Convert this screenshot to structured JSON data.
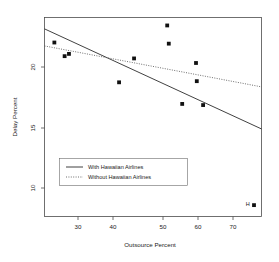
{
  "chart_data": {
    "type": "scatter",
    "title": "",
    "xlabel": "Outsource Percent",
    "ylabel": "Delay Percent",
    "xlim": [
      21.5,
      76.5
    ],
    "ylim": [
      7.3,
      24.8
    ],
    "xticks": [
      30,
      40,
      50,
      60,
      70
    ],
    "yticks": [
      20,
      15,
      10
    ],
    "xtick_labels": [
      "30",
      "40",
      "50",
      "60",
      "70"
    ],
    "ytick_labels": [
      "20",
      "15",
      "10"
    ],
    "grid": false,
    "legend_position": "center-left",
    "points": [
      {
        "x": 24.0,
        "y": 22.6,
        "label": ""
      },
      {
        "x": 26.6,
        "y": 21.4,
        "label": ""
      },
      {
        "x": 27.7,
        "y": 21.6,
        "label": ""
      },
      {
        "x": 40.4,
        "y": 19.1,
        "label": ""
      },
      {
        "x": 44.2,
        "y": 21.2,
        "label": ""
      },
      {
        "x": 52.6,
        "y": 24.1,
        "label": ""
      },
      {
        "x": 53.0,
        "y": 22.5,
        "label": ""
      },
      {
        "x": 56.4,
        "y": 17.2,
        "label": ""
      },
      {
        "x": 59.9,
        "y": 20.8,
        "label": ""
      },
      {
        "x": 60.1,
        "y": 19.2,
        "label": ""
      },
      {
        "x": 61.7,
        "y": 17.1,
        "label": ""
      },
      {
        "x": 74.6,
        "y": 8.3,
        "label": "H"
      }
    ],
    "series": [
      {
        "name": "With Hawaiian Airlines",
        "type": "line",
        "style": "solid",
        "x": [
          21.5,
          76.5
        ],
        "y": [
          23.8,
          15.0
        ]
      },
      {
        "name": "Without Hawaiian Airlines",
        "type": "line",
        "style": "dotted",
        "x": [
          21.5,
          76.5
        ],
        "y": [
          22.3,
          18.7
        ]
      }
    ],
    "legend": [
      {
        "label": "With Hawaiian Airlines",
        "style": "solid"
      },
      {
        "label": "Without Hawaiian Airlines",
        "style": "dotted"
      }
    ],
    "annotations": [
      {
        "text": "H",
        "x": 73.0,
        "y": 8.4
      }
    ],
    "colors": {
      "point": "#111111",
      "solid_line": "#2b2b2b",
      "dotted_line": "#555555",
      "axis": "#4d4d4d",
      "background": "#ffffff"
    }
  }
}
